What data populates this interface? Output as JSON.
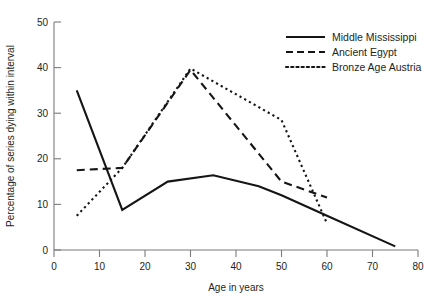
{
  "chart_data": {
    "type": "line",
    "title": "",
    "xlabel": "Age in years",
    "ylabel": "Percentage of series dying within interval",
    "xlim": [
      0,
      80
    ],
    "ylim": [
      0,
      50
    ],
    "xticks": [
      0,
      10,
      20,
      30,
      40,
      50,
      60,
      70,
      80
    ],
    "yticks": [
      0,
      10,
      20,
      30,
      40,
      50
    ],
    "xtick_labels": [
      "0",
      "10",
      "20",
      "30",
      "40",
      "50",
      "60",
      "70",
      "80"
    ],
    "ytick_labels": [
      "0",
      "10",
      "20",
      "30",
      "40",
      "50"
    ],
    "grid": false,
    "legend_position": "top-right",
    "series": [
      {
        "name": "Middle Mississippi",
        "style": "solid",
        "x": [
          5,
          15,
          25,
          35,
          45,
          50,
          60,
          75
        ],
        "values": [
          35.0,
          8.8,
          15.0,
          16.4,
          14.0,
          12.0,
          7.5,
          0.8
        ]
      },
      {
        "name": "Ancient Egypt",
        "style": "dashed",
        "x": [
          5,
          15,
          30,
          50,
          60
        ],
        "values": [
          17.5,
          18.0,
          39.5,
          15.0,
          11.5
        ]
      },
      {
        "name": "Bronze Age Austria",
        "style": "dotted",
        "x": [
          5,
          15,
          30,
          50,
          60
        ],
        "values": [
          7.5,
          18.0,
          39.8,
          28.5,
          5.8
        ]
      }
    ]
  },
  "axes": {
    "x_title": "Age in years",
    "y_title": "Percentage of series dying within interval",
    "x_tick_0": "0",
    "x_tick_1": "10",
    "x_tick_2": "20",
    "x_tick_3": "30",
    "x_tick_4": "40",
    "x_tick_5": "50",
    "x_tick_6": "60",
    "x_tick_7": "70",
    "x_tick_8": "80",
    "y_tick_0": "0",
    "y_tick_1": "10",
    "y_tick_2": "20",
    "y_tick_3": "30",
    "y_tick_4": "40",
    "y_tick_5": "50"
  },
  "legend": {
    "entries": [
      {
        "label": "Middle Mississippi"
      },
      {
        "label": "Ancient Egypt"
      },
      {
        "label": "Bronze Age Austria"
      }
    ]
  },
  "colors": {
    "line": "#151515",
    "axis": "#7b7b7b",
    "text": "#231f20",
    "background": "#ffffff"
  }
}
